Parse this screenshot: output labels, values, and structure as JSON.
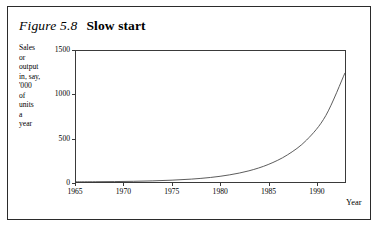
{
  "figure": {
    "number": "Figure 5.8",
    "title": "Slow start"
  },
  "ylabel_lines": [
    "Sales",
    "or",
    "output",
    "in, say,",
    "'000",
    "of",
    "units",
    "a",
    "year"
  ],
  "axis_title_x": "Year",
  "chart_data": {
    "type": "line",
    "title": "Slow start",
    "xlabel": "Year",
    "ylabel": "Sales or output in, say, '000 of units a year",
    "xlim": [
      1965,
      1993
    ],
    "ylim": [
      0,
      1500
    ],
    "xticks": [
      1965,
      1970,
      1975,
      1980,
      1985,
      1990
    ],
    "xtick_labels": [
      "1965",
      "1970",
      "1975",
      "1980",
      "1985",
      "1990"
    ],
    "yticks": [
      0,
      500,
      1000,
      1500
    ],
    "ytick_labels": [
      "0",
      "500",
      "1000",
      "1500"
    ],
    "grid": false,
    "legend": "none",
    "series": [
      {
        "name": "Sales or output",
        "x": [
          1965,
          1967,
          1969,
          1971,
          1973,
          1975,
          1977,
          1979,
          1981,
          1983,
          1985,
          1987,
          1989,
          1991,
          1993
        ],
        "values": [
          2,
          3,
          5,
          8,
          13,
          21,
          33,
          52,
          82,
          128,
          200,
          310,
          480,
          760,
          1250
        ]
      }
    ]
  }
}
